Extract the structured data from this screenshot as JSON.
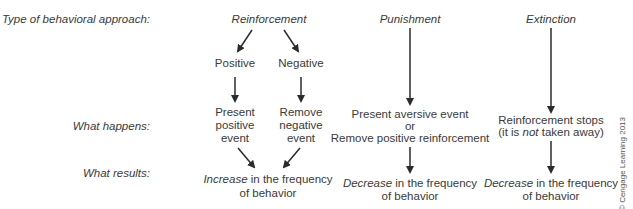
{
  "row_labels": {
    "approach": "Type of behavioral approach:",
    "happens": "What happens:",
    "results": "What results:"
  },
  "reinforcement": {
    "title": "Reinforcement",
    "positive": {
      "label": "Positive",
      "happens": [
        "Present",
        "positive",
        "event"
      ]
    },
    "negative": {
      "label": "Negative",
      "happens": [
        "Remove",
        "negative",
        "event"
      ]
    },
    "result_emph": "Increase",
    "result_rest": " in the frequency",
    "result_line2": "of behavior"
  },
  "punishment": {
    "title": "Punishment",
    "happens_line1": "Present aversive event",
    "happens_line2": "or",
    "happens_line3": "Remove positive reinforcement",
    "result_emph": "Decrease",
    "result_rest": " in the frequency",
    "result_line2": "of behavior"
  },
  "extinction": {
    "title": "Extinction",
    "happens_line1": "Reinforcement stops",
    "happens_line2_a": "(it is ",
    "happens_line2_emph": "not",
    "happens_line2_b": " taken away)",
    "result_emph": "Decrease",
    "result_rest": " in the frequency",
    "result_line2": "of behavior"
  },
  "copyright": "© Cengage Learning 2013",
  "colors": {
    "text": "#3a3a3a",
    "arrow": "#2b2b2b",
    "background": "#ffffff"
  }
}
